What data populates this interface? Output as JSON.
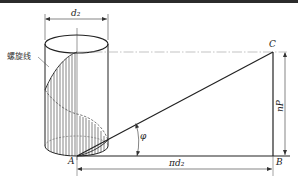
{
  "diagram": {
    "labels": {
      "d2": "d₂",
      "helix": "螺旋线",
      "A": "A",
      "B": "B",
      "C": "C",
      "phi": "φ",
      "nP": "nP",
      "pi_d2": "πd₂"
    },
    "points": {
      "A": [
        77,
        156
      ],
      "B": [
        273,
        156
      ],
      "C": [
        273,
        52
      ]
    },
    "cylinder": {
      "left_x": 45,
      "right_x": 108,
      "axis_x": 77,
      "top_center_y": 44,
      "bottom_center_y": 146,
      "ellipse_ry": 9
    },
    "colors": {
      "line": "#222222",
      "thin": "#444444",
      "centerline": "#9a9a9a",
      "topbar": "#2b2b2b"
    }
  }
}
